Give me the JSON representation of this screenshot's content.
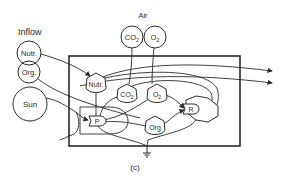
{
  "diagram": {
    "caption": "(c)",
    "colors": {
      "ink": "#2a2a2a",
      "background": "#ffffff"
    },
    "external_sources": {
      "inflow": {
        "label": "Inflow",
        "nodes": [
          {
            "id": "inflow-nutr",
            "label": "Nutr."
          },
          {
            "id": "inflow-org",
            "label": "Org."
          }
        ]
      },
      "sun": {
        "label": "Sun"
      },
      "air": {
        "label": "Air",
        "nodes": [
          {
            "id": "air-co2",
            "label": "CO",
            "sub": "2"
          },
          {
            "id": "air-o2",
            "label": "O",
            "sub": "2"
          }
        ]
      }
    },
    "storages": [
      {
        "id": "store-nutr",
        "label": "Nutr."
      },
      {
        "id": "store-co2",
        "label": "CO",
        "sub": "2"
      },
      {
        "id": "store-o2",
        "label": "O",
        "sub": "2"
      },
      {
        "id": "store-org",
        "label": "Org"
      }
    ],
    "processes": [
      {
        "id": "producer",
        "label": "P"
      },
      {
        "id": "respiration",
        "label": "R"
      }
    ],
    "sink": {
      "id": "heat-sink",
      "label": ""
    }
  }
}
